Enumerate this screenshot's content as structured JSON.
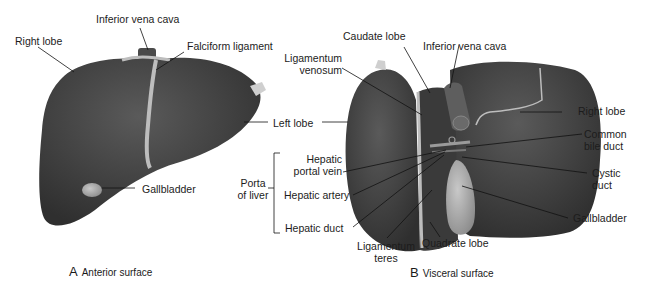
{
  "figure": {
    "panels": [
      {
        "id": "A",
        "letter": "A",
        "caption": "Anterior surface",
        "labels": {
          "inferior_vena_cava": "Inferior vena cava",
          "right_lobe": "Right lobe",
          "falciform_ligament": "Falciform ligament",
          "left_lobe": "Left lobe",
          "gallbladder": "Gallbladder"
        }
      },
      {
        "id": "B",
        "letter": "B",
        "caption": "Visceral surface",
        "labels": {
          "caudate_lobe": "Caudate lobe",
          "inferior_vena_cava": "Inferior vena cava",
          "ligamentum_venosum_1": "Ligamentum",
          "ligamentum_venosum_2": "venosum",
          "right_lobe": "Right lobe",
          "common_bile_duct_1": "Common",
          "common_bile_duct_2": "bile duct",
          "hepatic_portal_vein_1": "Hepatic",
          "hepatic_portal_vein_2": "portal vein",
          "hepatic_artery": "Hepatic artery",
          "hepatic_duct": "Hepatic duct",
          "porta_of_liver_1": "Porta",
          "porta_of_liver_2": "of liver",
          "cystic_duct_1": "Cystic",
          "cystic_duct_2": "duct",
          "gallbladder": "Gallbladder",
          "ligamentum_teres_1": "Ligamentum",
          "ligamentum_teres_2": "teres",
          "quadrate_lobe": "Quadrate lobe"
        }
      }
    ],
    "colors": {
      "liver": "#3d3d3d",
      "liver_highlight": "#555555",
      "ligament": "#bdbdbd",
      "gallbladder": "#9a9a9a",
      "leader_line": "#111111"
    }
  }
}
